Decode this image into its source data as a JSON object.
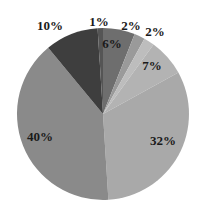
{
  "chart_data": {
    "type": "pie",
    "title": "",
    "start_angle_deg": 0,
    "direction": "clockwise",
    "slices": [
      {
        "label": "6%",
        "value": 6,
        "color": "#6e6e6e"
      },
      {
        "label": "2%",
        "value": 2,
        "color": "#9a9a9a"
      },
      {
        "label": "2%",
        "value": 2,
        "color": "#bdbdbd"
      },
      {
        "label": "7%",
        "value": 7,
        "color": "#b3b3b3"
      },
      {
        "label": "32%",
        "value": 32,
        "color": "#a9a9a9"
      },
      {
        "label": "40%",
        "value": 40,
        "color": "#8a8a8a"
      },
      {
        "label": "10%",
        "value": 10,
        "color": "#3e3e3e"
      },
      {
        "label": "1%",
        "value": 1,
        "color": "#555555"
      }
    ],
    "values": [
      6,
      2,
      2,
      7,
      32,
      40,
      10,
      1
    ],
    "categories": [
      "6%",
      "2%",
      "2%",
      "7%",
      "32%",
      "40%",
      "10%",
      "1%"
    ],
    "legend": "none"
  }
}
